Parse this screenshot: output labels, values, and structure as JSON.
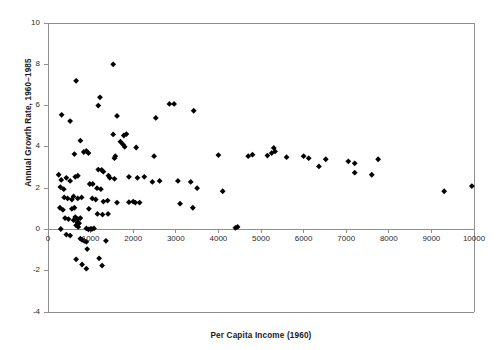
{
  "chart_data": {
    "type": "scatter",
    "title": "",
    "xlabel": "Per Capita Income (1960)",
    "ylabel": "Annual Growth Rate, 1960–1985",
    "xlim": [
      0,
      10000
    ],
    "ylim": [
      -4,
      10
    ],
    "xticks": [
      0,
      1000,
      2000,
      3000,
      4000,
      5000,
      6000,
      7000,
      8000,
      9000,
      10000
    ],
    "xtick_labels": [
      "0",
      "1000",
      "2000",
      "3000",
      "4000",
      "5000",
      "6000",
      "7000",
      "8000",
      "9000",
      "10000"
    ],
    "yticks": [
      -4,
      -2,
      0,
      2,
      4,
      6,
      8,
      10
    ],
    "ytick_labels": [
      "-4",
      "-2",
      "0",
      "2",
      "4",
      "6",
      "8",
      "10"
    ],
    "grid": false,
    "legend": false,
    "marker": "diamond",
    "marker_color": "#000000",
    "marker_size": 4.6,
    "frame_color": "#8f8f8f",
    "series": [
      {
        "name": "Countries",
        "points": [
          [
            1530,
            8.0
          ],
          [
            660,
            7.2
          ],
          [
            1220,
            6.4
          ],
          [
            1180,
            6.0
          ],
          [
            2850,
            6.08
          ],
          [
            2960,
            6.08
          ],
          [
            320,
            5.55
          ],
          [
            1620,
            5.5
          ],
          [
            3420,
            5.75
          ],
          [
            520,
            5.25
          ],
          [
            2530,
            5.4
          ],
          [
            1530,
            4.6
          ],
          [
            1780,
            4.55
          ],
          [
            1840,
            4.62
          ],
          [
            760,
            4.3
          ],
          [
            1760,
            4.12
          ],
          [
            1800,
            4.0
          ],
          [
            1700,
            4.25
          ],
          [
            2070,
            3.97
          ],
          [
            620,
            3.65
          ],
          [
            840,
            3.75
          ],
          [
            900,
            3.8
          ],
          [
            950,
            3.7
          ],
          [
            2490,
            3.55
          ],
          [
            1580,
            3.55
          ],
          [
            1560,
            3.45
          ],
          [
            4000,
            3.6
          ],
          [
            5150,
            3.58
          ],
          [
            5300,
            3.95
          ],
          [
            5250,
            3.7
          ],
          [
            5330,
            3.78
          ],
          [
            5600,
            3.5
          ],
          [
            6000,
            3.55
          ],
          [
            6120,
            3.45
          ],
          [
            6520,
            3.4
          ],
          [
            7200,
            3.2
          ],
          [
            7050,
            3.3
          ],
          [
            7750,
            3.4
          ],
          [
            6360,
            3.05
          ],
          [
            7200,
            2.75
          ],
          [
            7600,
            2.65
          ],
          [
            4700,
            3.55
          ],
          [
            4800,
            3.62
          ],
          [
            9300,
            1.85
          ],
          [
            9950,
            2.1
          ],
          [
            250,
            2.65
          ],
          [
            310,
            2.4
          ],
          [
            430,
            2.5
          ],
          [
            520,
            2.35
          ],
          [
            640,
            2.55
          ],
          [
            700,
            2.6
          ],
          [
            1180,
            2.9
          ],
          [
            1260,
            2.88
          ],
          [
            1300,
            2.8
          ],
          [
            1420,
            2.6
          ],
          [
            1450,
            2.5
          ],
          [
            1560,
            2.45
          ],
          [
            1900,
            2.55
          ],
          [
            2100,
            2.5
          ],
          [
            2260,
            2.55
          ],
          [
            2450,
            2.3
          ],
          [
            2620,
            2.35
          ],
          [
            3050,
            2.35
          ],
          [
            3350,
            2.3
          ],
          [
            3500,
            2.0
          ],
          [
            4100,
            1.85
          ],
          [
            290,
            2.05
          ],
          [
            370,
            1.95
          ],
          [
            980,
            2.2
          ],
          [
            1050,
            2.2
          ],
          [
            1150,
            2.0
          ],
          [
            1240,
            1.95
          ],
          [
            380,
            1.55
          ],
          [
            460,
            1.5
          ],
          [
            560,
            1.45
          ],
          [
            600,
            1.6
          ],
          [
            700,
            1.5
          ],
          [
            790,
            1.55
          ],
          [
            1040,
            1.5
          ],
          [
            1120,
            1.45
          ],
          [
            1300,
            1.35
          ],
          [
            1400,
            1.4
          ],
          [
            1620,
            1.3
          ],
          [
            1900,
            1.32
          ],
          [
            2000,
            1.35
          ],
          [
            2050,
            1.3
          ],
          [
            2150,
            1.3
          ],
          [
            3100,
            1.25
          ],
          [
            3400,
            1.05
          ],
          [
            280,
            1.05
          ],
          [
            350,
            0.95
          ],
          [
            560,
            1.0
          ],
          [
            620,
            1.05
          ],
          [
            960,
            1.0
          ],
          [
            1160,
            0.75
          ],
          [
            1280,
            0.72
          ],
          [
            1410,
            0.75
          ],
          [
            400,
            0.55
          ],
          [
            480,
            0.5
          ],
          [
            600,
            0.45
          ],
          [
            640,
            0.6
          ],
          [
            690,
            0.35
          ],
          [
            700,
            0.5
          ],
          [
            730,
            0.3
          ],
          [
            760,
            0.55
          ],
          [
            660,
            0.2
          ],
          [
            710,
            0.12
          ],
          [
            300,
            0.02
          ],
          [
            900,
            0.05
          ],
          [
            950,
            0.0
          ],
          [
            1000,
            0.03
          ],
          [
            1030,
            0.02
          ],
          [
            1080,
            0.05
          ],
          [
            4400,
            0.08
          ],
          [
            4450,
            0.12
          ],
          [
            430,
            -0.25
          ],
          [
            520,
            -0.3
          ],
          [
            760,
            -0.45
          ],
          [
            800,
            -0.5
          ],
          [
            850,
            -0.55
          ],
          [
            900,
            -0.6
          ],
          [
            1360,
            -0.55
          ],
          [
            920,
            -0.95
          ],
          [
            660,
            -1.45
          ],
          [
            1200,
            -1.4
          ],
          [
            800,
            -1.7
          ],
          [
            900,
            -1.9
          ],
          [
            1270,
            -1.75
          ]
        ]
      }
    ]
  }
}
